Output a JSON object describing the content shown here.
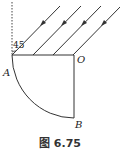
{
  "figure": {
    "caption": "图 6.75",
    "labels": {
      "A": "A",
      "O": "O",
      "B": "B"
    },
    "angle_label": "45",
    "ray_count": 4,
    "colors": {
      "line": "#333333",
      "background": "#ffffff"
    }
  }
}
